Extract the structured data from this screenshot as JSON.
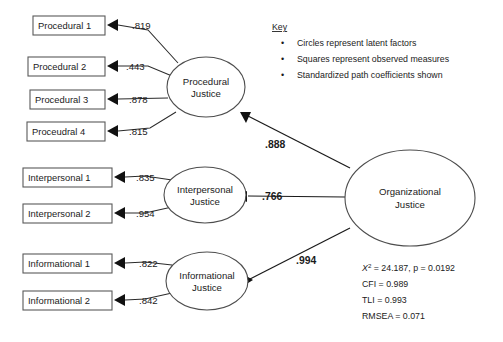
{
  "diagram": {
    "type": "sem-path-diagram",
    "background_color": "#ffffff",
    "line_color": "#2b2b2b"
  },
  "observed_measures": [
    {
      "label": "Procedural 1",
      "loading": ".819",
      "factor": "Procedural Justice"
    },
    {
      "label": "Procedural 2",
      "loading": ".443",
      "factor": "Procedural Justice"
    },
    {
      "label": "Procedural 3",
      "loading": ".878",
      "factor": "Procedural Justice"
    },
    {
      "label": "Proceudral 4",
      "loading": ".815",
      "factor": "Procedural Justice"
    },
    {
      "label": "Interpersonal 1",
      "loading": ".835",
      "factor": "Interpersonal Justice"
    },
    {
      "label": "Interpersonal 2",
      "loading": ".954",
      "factor": "Interpersonal Justice"
    },
    {
      "label": "Informational 1",
      "loading": ".822",
      "factor": "Informational Justice"
    },
    {
      "label": "Informational 2",
      "loading": ".842",
      "factor": "Informational Justice"
    }
  ],
  "latent_factors": [
    {
      "line1": "Procedural",
      "line2": "Justice"
    },
    {
      "line1": "Interpersonal",
      "line2": "Justice"
    },
    {
      "line1": "Informational",
      "line2": "Justice"
    },
    {
      "line1": "Organizational",
      "line2": "Justice"
    }
  ],
  "structural_paths": [
    {
      "from": "Organizational Justice",
      "to": "Procedural Justice",
      "coefficient": ".888"
    },
    {
      "from": "Organizational Justice",
      "to": "Interpersonal Justice",
      "coefficient": ".766"
    },
    {
      "from": "Organizational Justice",
      "to": "Informational Justice",
      "coefficient": ".994"
    }
  ],
  "key": {
    "title": "Key",
    "bullet": "•",
    "items": [
      "Circles represent latent factors",
      "Squares represent observed measures",
      "Standardized path coefficients shown"
    ]
  },
  "fit_statistics": {
    "chi_square_symbol": "X",
    "chi_square_exponent": "2",
    "chi_square_rest": " = 24.187, p = 0.0192",
    "lines": [
      "CFI = 0.989",
      "TLI = 0.993",
      "RMSEA = 0.071"
    ]
  }
}
